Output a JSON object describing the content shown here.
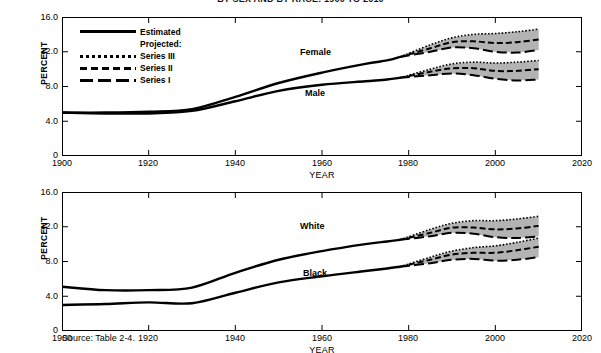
{
  "title": "BY SEX AND BY RACE: 1900 TO 2010",
  "source_note": "Source:  Table 2-4.",
  "legend": {
    "estimated": "Estimated",
    "projected": "Projected:",
    "series3": "Series III",
    "series2": "Series II",
    "series1": "Series I"
  },
  "axes": {
    "ylabel": "PERCENT",
    "xlabel": "YEAR",
    "yticks": [
      "0",
      "4.0",
      "8.0",
      "12.0",
      "16.0"
    ],
    "xticks": [
      "1900",
      "1920",
      "1940",
      "1960",
      "1980",
      "2000",
      "2020"
    ],
    "ylim": [
      0,
      16
    ],
    "xlim": [
      1900,
      2020
    ]
  },
  "chart_data": [
    {
      "type": "line",
      "title": "BY SEX AND BY RACE: 1900 TO 2010",
      "panel": "top",
      "xlabel": "YEAR",
      "ylabel": "PERCENT",
      "xlim": [
        1900,
        2020
      ],
      "ylim": [
        0,
        16
      ],
      "grid": false,
      "legend_position": "upper-left",
      "annotations": [
        "Female",
        "Male"
      ],
      "series": [
        {
          "name": "Female",
          "style": "Estimated",
          "x": [
            1900,
            1910,
            1920,
            1930,
            1940,
            1950,
            1960,
            1970,
            1975,
            1978
          ],
          "values": [
            5.0,
            5.0,
            5.1,
            5.4,
            6.8,
            8.4,
            9.6,
            10.6,
            11.0,
            11.4
          ]
        },
        {
          "name": "Female Series III",
          "style": "Projected dotted",
          "x": [
            1978,
            1985,
            1990,
            1995,
            2000,
            2005,
            2010
          ],
          "values": [
            11.4,
            12.8,
            13.6,
            14.0,
            14.1,
            14.3,
            14.6
          ]
        },
        {
          "name": "Female Series II",
          "style": "Projected dashed",
          "x": [
            1978,
            1985,
            1990,
            1995,
            2000,
            2005,
            2010
          ],
          "values": [
            11.4,
            12.4,
            13.1,
            13.2,
            13.0,
            13.1,
            13.4
          ]
        },
        {
          "name": "Female Series I",
          "style": "Projected long-dash",
          "x": [
            1978,
            1985,
            1990,
            1995,
            2000,
            2005,
            2010
          ],
          "values": [
            11.4,
            12.0,
            12.5,
            12.4,
            12.0,
            11.9,
            12.2
          ]
        },
        {
          "name": "Male",
          "style": "Estimated",
          "x": [
            1900,
            1910,
            1920,
            1930,
            1940,
            1950,
            1960,
            1970,
            1975,
            1978
          ],
          "values": [
            5.0,
            4.9,
            4.9,
            5.2,
            6.3,
            7.5,
            8.2,
            8.6,
            8.8,
            9.0
          ]
        },
        {
          "name": "Male Series III",
          "style": "Projected dotted",
          "x": [
            1978,
            1985,
            1990,
            1995,
            2000,
            2005,
            2010
          ],
          "values": [
            9.0,
            10.0,
            10.6,
            10.8,
            10.7,
            10.8,
            11.0
          ]
        },
        {
          "name": "Male Series II",
          "style": "Projected dashed",
          "x": [
            1978,
            1985,
            1990,
            1995,
            2000,
            2005,
            2010
          ],
          "values": [
            9.0,
            9.7,
            10.1,
            10.1,
            9.8,
            9.8,
            10.0
          ]
        },
        {
          "name": "Male Series I",
          "style": "Projected long-dash",
          "x": [
            1978,
            1985,
            1990,
            1995,
            2000,
            2005,
            2010
          ],
          "values": [
            9.0,
            9.3,
            9.5,
            9.3,
            8.9,
            8.7,
            8.8
          ]
        }
      ]
    },
    {
      "type": "line",
      "panel": "bottom",
      "xlabel": "YEAR",
      "ylabel": "PERCENT",
      "xlim": [
        1900,
        2020
      ],
      "ylim": [
        0,
        16
      ],
      "grid": false,
      "annotations": [
        "White",
        "Black"
      ],
      "series": [
        {
          "name": "White",
          "style": "Estimated",
          "x": [
            1900,
            1910,
            1920,
            1930,
            1940,
            1950,
            1960,
            1970,
            1975,
            1978
          ],
          "values": [
            5.1,
            4.7,
            4.7,
            5.0,
            6.7,
            8.2,
            9.2,
            10.0,
            10.3,
            10.5
          ]
        },
        {
          "name": "White Series III",
          "style": "Projected dotted",
          "x": [
            1978,
            1985,
            1990,
            1995,
            2000,
            2005,
            2010
          ],
          "values": [
            10.5,
            11.7,
            12.4,
            12.7,
            12.7,
            12.9,
            13.2
          ]
        },
        {
          "name": "White Series II",
          "style": "Projected dashed",
          "x": [
            1978,
            1985,
            1990,
            1995,
            2000,
            2005,
            2010
          ],
          "values": [
            10.5,
            11.3,
            11.9,
            11.9,
            11.7,
            11.8,
            12.1
          ]
        },
        {
          "name": "White Series I",
          "style": "Projected long-dash",
          "x": [
            1978,
            1985,
            1990,
            1995,
            2000,
            2005,
            2010
          ],
          "values": [
            10.5,
            10.9,
            11.3,
            11.2,
            10.8,
            10.7,
            10.9
          ]
        },
        {
          "name": "Black",
          "style": "Estimated",
          "x": [
            1900,
            1910,
            1920,
            1930,
            1940,
            1950,
            1960,
            1970,
            1975,
            1978
          ],
          "values": [
            3.0,
            3.1,
            3.3,
            3.2,
            4.4,
            5.6,
            6.3,
            6.9,
            7.2,
            7.4
          ]
        },
        {
          "name": "Black Series III",
          "style": "Projected dotted",
          "x": [
            1978,
            1985,
            1990,
            1995,
            2000,
            2005,
            2010
          ],
          "values": [
            7.4,
            8.5,
            9.2,
            9.6,
            9.8,
            10.2,
            10.7
          ]
        },
        {
          "name": "Black Series II",
          "style": "Projected dashed",
          "x": [
            1978,
            1985,
            1990,
            1995,
            2000,
            2005,
            2010
          ],
          "values": [
            7.4,
            8.2,
            8.8,
            9.0,
            9.0,
            9.3,
            9.7
          ]
        },
        {
          "name": "Black Series I",
          "style": "Projected long-dash",
          "x": [
            1978,
            1985,
            1990,
            1995,
            2000,
            2005,
            2010
          ],
          "values": [
            7.4,
            7.8,
            8.2,
            8.3,
            8.1,
            8.2,
            8.5
          ]
        }
      ]
    }
  ],
  "labels": {
    "female": "Female",
    "male": "Male",
    "white": "White",
    "black": "Black"
  },
  "colors": {
    "line": "#000000",
    "band": "#b3b3b3",
    "frame": "#000000",
    "background": "#ffffff"
  }
}
